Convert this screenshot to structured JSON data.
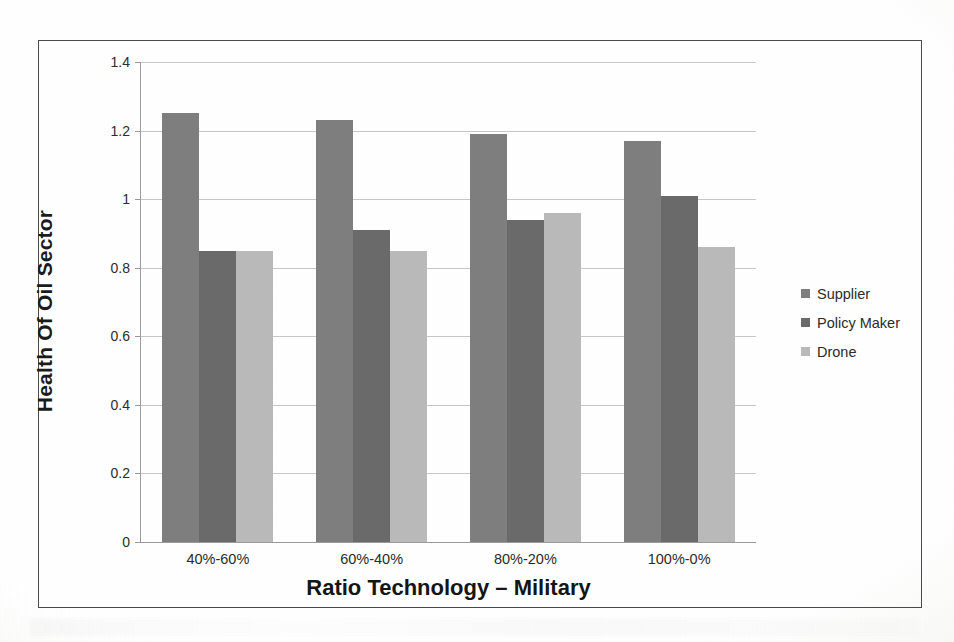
{
  "chart_data": {
    "type": "bar",
    "title": "",
    "xlabel": "Ratio Technology – Military",
    "ylabel": "Health Of Oil Sector",
    "categories": [
      "40%-60%",
      "60%-40%",
      "80%-20%",
      "100%-0%"
    ],
    "series": [
      {
        "name": "Supplier",
        "color": "#7e7e7e",
        "values": [
          1.25,
          1.23,
          1.19,
          1.17
        ]
      },
      {
        "name": "Policy Maker",
        "color": "#6a6a6a",
        "values": [
          0.85,
          0.91,
          0.94,
          1.01
        ]
      },
      {
        "name": "Drone",
        "color": "#b9b9b9",
        "values": [
          0.85,
          0.85,
          0.96,
          0.86
        ]
      }
    ],
    "ylim": [
      0,
      1.4
    ],
    "yticks": [
      "0",
      "0.2",
      "0.4",
      "0.6",
      "0.8",
      "1",
      "1.2",
      "1.4"
    ],
    "ytick_values": [
      0,
      0.2,
      0.4,
      0.6,
      0.8,
      1.0,
      1.2,
      1.4
    ],
    "grid": true,
    "legend_position": "right",
    "legend": [
      "Supplier",
      "Policy Maker",
      "Drone"
    ]
  }
}
